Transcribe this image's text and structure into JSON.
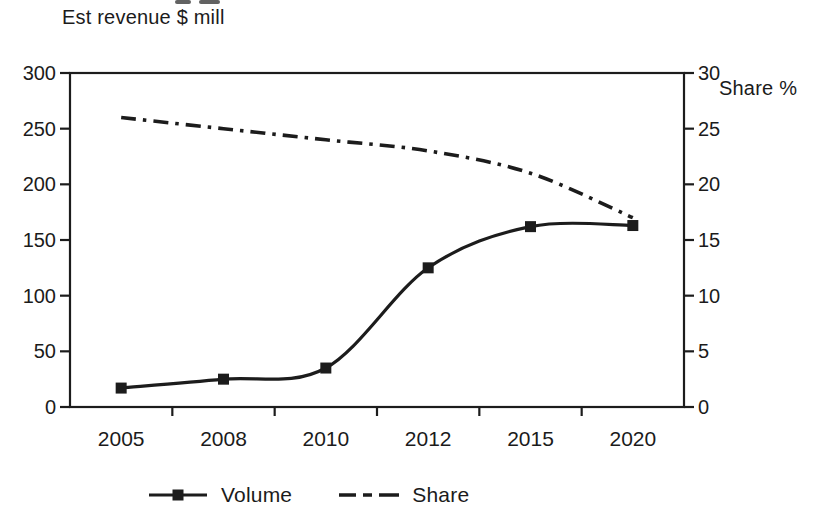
{
  "chart_data": {
    "type": "line",
    "title": "Est revenue $ mill",
    "categories": [
      "2005",
      "2008",
      "2010",
      "2012",
      "2015",
      "2020"
    ],
    "series": [
      {
        "name": "Volume",
        "axis": "left",
        "line_style": "solid",
        "marker": "square",
        "values": [
          17,
          25,
          35,
          125,
          162,
          163
        ]
      },
      {
        "name": "Share",
        "axis": "right",
        "line_style": "dash-dot",
        "marker": "none",
        "values": [
          26,
          25,
          24,
          23,
          21,
          17
        ]
      }
    ],
    "left_axis": {
      "title": "Est revenue $ mill",
      "min": 0,
      "max": 300,
      "ticks": [
        0,
        50,
        100,
        150,
        200,
        250,
        300
      ]
    },
    "right_axis": {
      "title": "Share %",
      "min": 0,
      "max": 30,
      "ticks": [
        0,
        5,
        10,
        15,
        20,
        25,
        30
      ]
    },
    "x_axis": {
      "tick_position": "between-categories"
    },
    "legend": {
      "position": "bottom"
    },
    "grid": false,
    "ink_color": "#1c1c1c",
    "background": "#ffffff"
  }
}
